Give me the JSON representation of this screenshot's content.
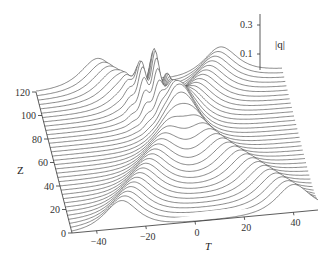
{
  "chart_data": {
    "type": "surface-waterfall",
    "title": "",
    "xlabel": "T",
    "ylabel": "Z",
    "zlabel": "|q|",
    "x_ticks": [
      -40,
      -20,
      0,
      20,
      40
    ],
    "y_ticks": [
      0,
      20,
      40,
      60,
      80,
      100,
      120
    ],
    "z_ticks": [
      0.1,
      0.3
    ],
    "x_range": [
      -50,
      50
    ],
    "y_range": [
      0,
      120
    ],
    "z_range": [
      0,
      0.35
    ],
    "num_slices": 34,
    "series": [
      {
        "name": "soliton-1",
        "amplitude": 0.22,
        "t_at_z0": -30,
        "t_at_z120": 25,
        "width": 6
      },
      {
        "name": "soliton-2",
        "amplitude": 0.22,
        "t_at_z0": 40,
        "t_at_z120": -25,
        "width": 6
      },
      {
        "name": "collision-peak",
        "amplitude": 0.34,
        "t_center": -5,
        "z_center": 95,
        "oscillation": true
      }
    ]
  },
  "labels": {
    "x_axis": "T",
    "y_axis": "Z",
    "z_axis": "|q|",
    "x_tick_labels": [
      "−40",
      "−20",
      "0",
      "20",
      "40"
    ],
    "y_tick_labels": [
      "0",
      "20",
      "40",
      "60",
      "80",
      "100",
      "120"
    ],
    "z_tick_labels": [
      "0.3",
      "0.1"
    ]
  }
}
